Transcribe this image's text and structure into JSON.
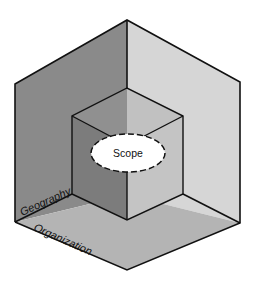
{
  "diagram": {
    "type": "nested-isometric-cube",
    "center_label": "Scope",
    "axis_labels": {
      "vertical_face": "Geography",
      "floor_face": "Organization"
    },
    "colors": {
      "left_wall": "#8a8a8a",
      "right_wall": "#d6d6d6",
      "floor": "#b4b4b4",
      "inner_left_wall": "#7c7c7c",
      "inner_right_wall": "#c8c8c8",
      "inner_floor": "#a9a9a9",
      "edge": "#111111",
      "ellipse_fill": "#ffffff"
    }
  }
}
